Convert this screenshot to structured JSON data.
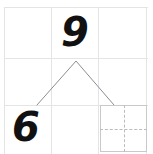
{
  "worksheet": {
    "title": "Handwritten math grid worksheet",
    "background_color": "#ffffff",
    "width": 153,
    "height": 154,
    "grid": {
      "columns": 3,
      "rows": 3,
      "line_color": "#e4e4e6",
      "origin_x": 4,
      "origin_y": 7,
      "cell_width": 47,
      "cell_height": 47,
      "vertical_line_x": [
        4,
        51,
        98,
        146
      ],
      "horizontal_line_y": [
        7,
        58,
        105
      ]
    },
    "cells": [
      {
        "row": 0,
        "col": 0,
        "content": ""
      },
      {
        "row": 0,
        "col": 1,
        "content": "9"
      },
      {
        "row": 0,
        "col": 2,
        "content": ""
      },
      {
        "row": 1,
        "col": 0,
        "content": ""
      },
      {
        "row": 1,
        "col": 1,
        "content": ""
      },
      {
        "row": 1,
        "col": 2,
        "content": ""
      },
      {
        "row": 2,
        "col": 0,
        "content": "6"
      },
      {
        "row": 2,
        "col": 1,
        "content": ""
      },
      {
        "row": 2,
        "col": 2,
        "content": ""
      }
    ],
    "digits": {
      "top_middle": "9",
      "bottom_left": "6",
      "ink_color": "#111111"
    },
    "caret": {
      "shape": "inverted-v",
      "stroke_color": "#8d8d92",
      "stroke_width": 1,
      "left_point": {
        "x": 37,
        "y": 105
      },
      "apex": {
        "x": 76,
        "y": 61
      },
      "right_point": {
        "x": 114,
        "y": 105
      }
    },
    "dashed_box": {
      "border_color": "#c9c9cc",
      "dash_color": "#bcbcc0",
      "x": 100,
      "y": 105,
      "width": 47,
      "height": 47,
      "crosshair": true
    }
  }
}
